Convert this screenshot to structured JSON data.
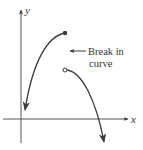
{
  "diagram": {
    "type": "function-graph",
    "axes": {
      "x_label": "x",
      "y_label": "y"
    },
    "annotation": {
      "line1": "Break in",
      "line2": "curve"
    },
    "points": [
      {
        "name": "closed-endpoint",
        "style": "filled"
      },
      {
        "name": "open-endpoint",
        "style": "hollow"
      }
    ],
    "colors": {
      "stroke": "#3a3a3a",
      "axis": "#555555",
      "text": "#333333"
    }
  }
}
